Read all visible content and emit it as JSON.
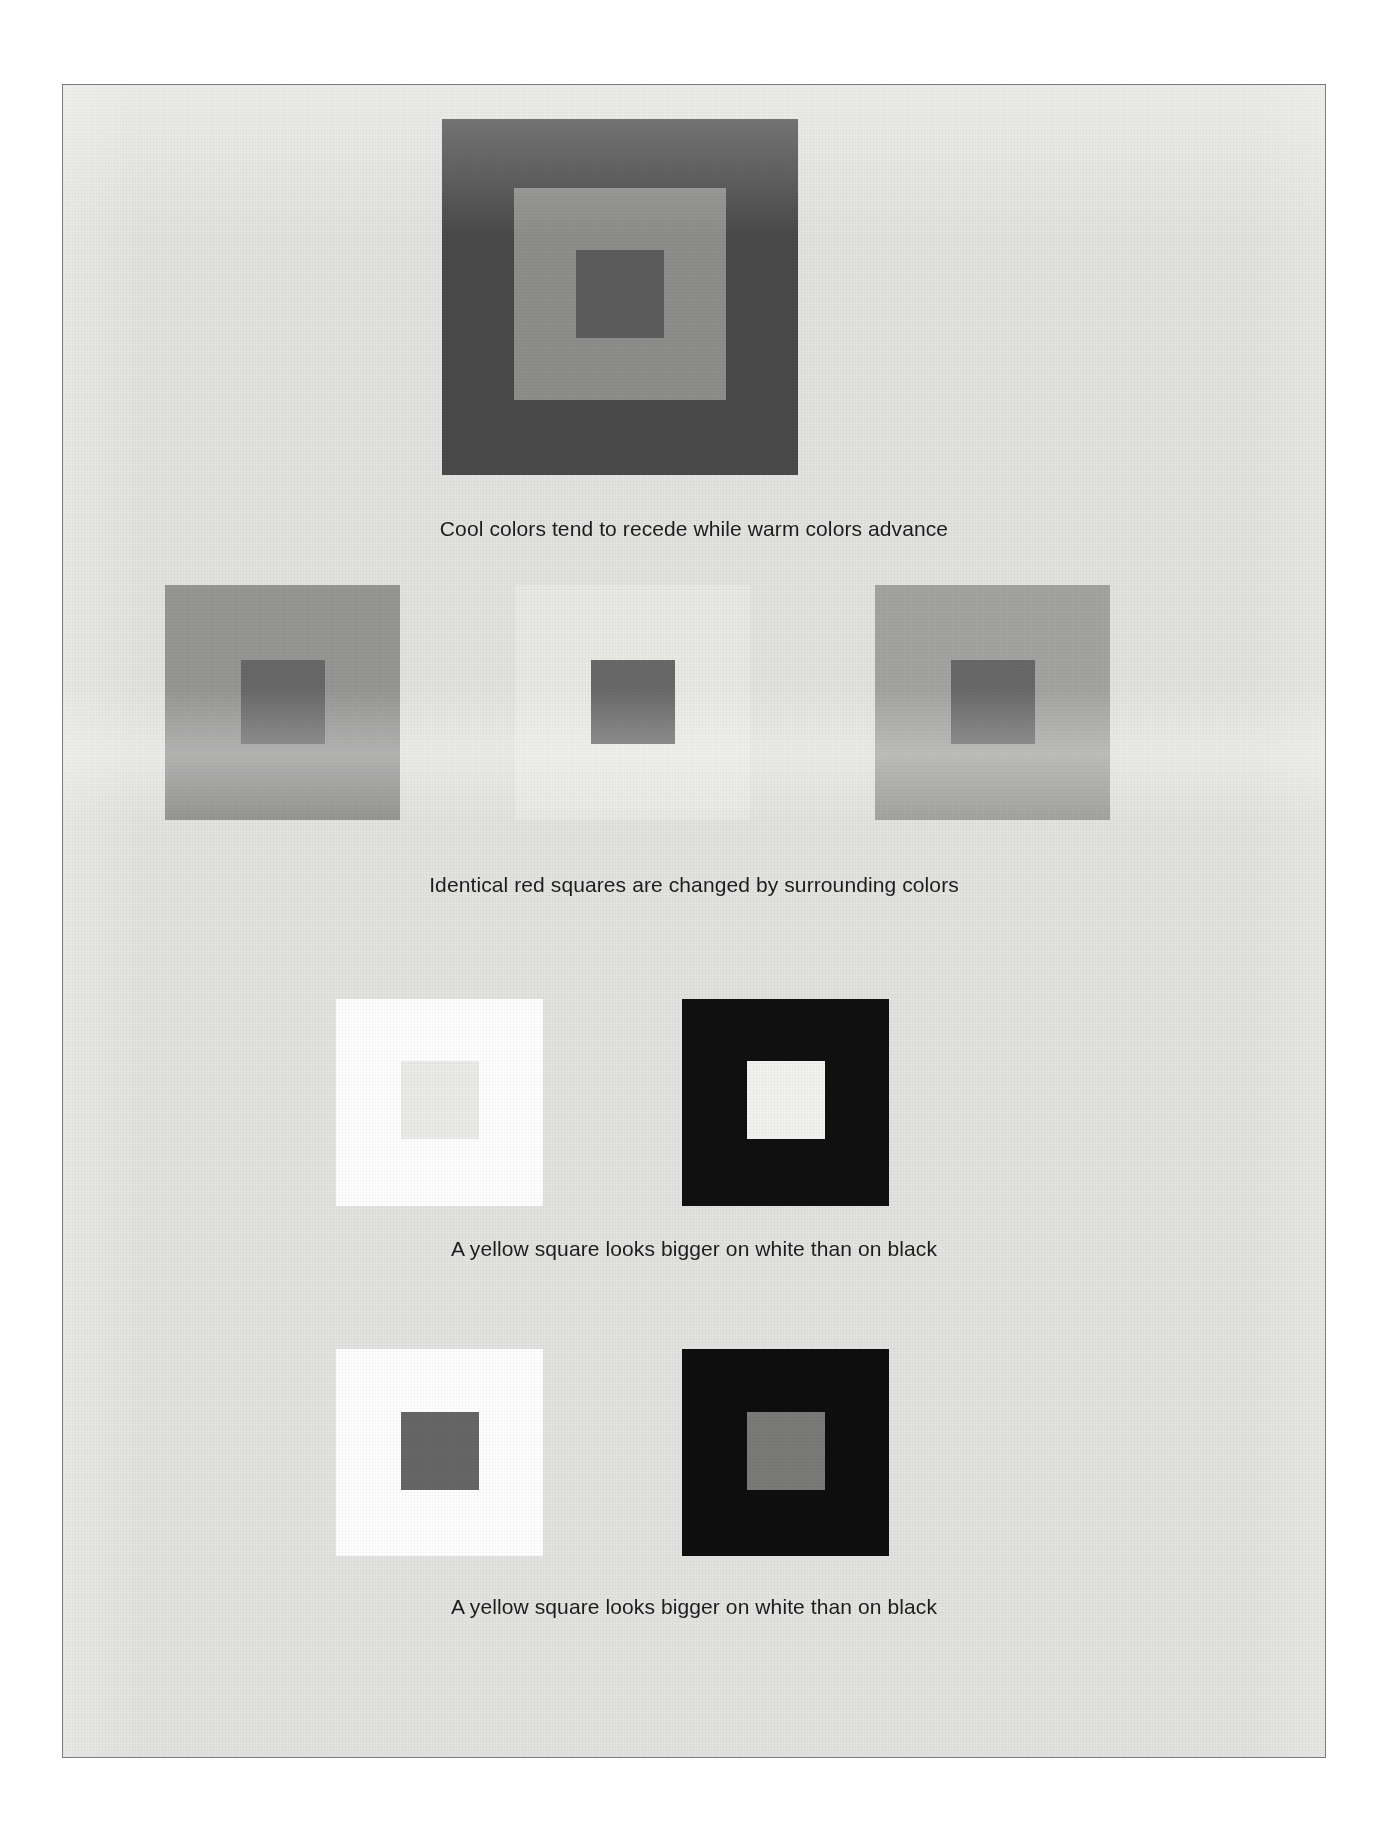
{
  "plate": {
    "background_color": "#e3e3e1",
    "border_color": "#7d7d7b"
  },
  "figures": [
    {
      "id": "nested-three-square",
      "caption": "Cool colors tend to recede while warm colors advance",
      "panels": [
        {
          "name": "cool-warm-nested-square",
          "outer_color": "#4a4a4a",
          "outer_size": 356,
          "mid_color": "#8d8d8b",
          "mid_size": 212,
          "inner_color": "#5c5c5c",
          "inner_size": 88
        }
      ]
    },
    {
      "id": "identical-red-squares",
      "caption": "Identical red squares are changed by surrounding colors",
      "panels": [
        {
          "name": "red-square-on-medium-gray",
          "outer_color": "#969695",
          "outer_size": 235,
          "inner_color": "#686868",
          "inner_size": 84
        },
        {
          "name": "red-square-on-light-gray",
          "outer_color": "#e9e9e6",
          "outer_size": 235,
          "inner_color": "#686868",
          "inner_size": 84
        },
        {
          "name": "red-square-on-mid-light-gray",
          "outer_color": "#a3a3a1",
          "outer_size": 235,
          "inner_color": "#686868",
          "inner_size": 84
        }
      ]
    },
    {
      "id": "yellow-square-size-illusion-light",
      "caption": "A yellow square looks bigger on white than on black",
      "panels": [
        {
          "name": "light-square-on-white",
          "outer_color": "#ffffff",
          "outer_size": 207,
          "inner_color": "#ebebe9",
          "inner_size": 78
        },
        {
          "name": "light-square-on-black",
          "outer_color": "#101010",
          "outer_size": 207,
          "inner_color": "#f2f2ee",
          "inner_size": 78
        }
      ]
    },
    {
      "id": "yellow-square-size-illusion-dark",
      "caption": "A yellow square looks bigger on white than on black",
      "panels": [
        {
          "name": "dark-square-on-white",
          "outer_color": "#ffffff",
          "outer_size": 207,
          "inner_color": "#666666",
          "inner_size": 78
        },
        {
          "name": "dark-square-on-black",
          "outer_color": "#0e0e0e",
          "outer_size": 207,
          "inner_color": "#7a7a78",
          "inner_size": 78
        }
      ]
    }
  ]
}
